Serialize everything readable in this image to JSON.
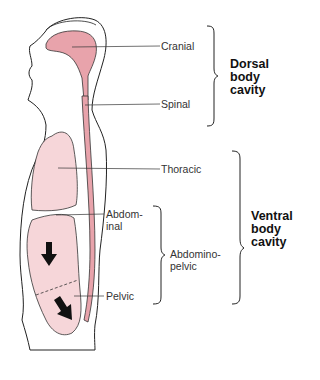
{
  "labels": {
    "cranial": "Cranial",
    "spinal": "Spinal",
    "thoracic": "Thoracic",
    "abdominal_1": "Abdom-",
    "abdominal_2": "inal",
    "abdominopelvic_1": "Abdomino-",
    "abdominopelvic_2": "pelvic",
    "pelvic": "Pelvic"
  },
  "groups": {
    "dorsal": [
      "Dorsal",
      "body",
      "cavity"
    ],
    "ventral": [
      "Ventral",
      "body",
      "cavity"
    ]
  },
  "colors": {
    "dorsal_cavity": "#e8a3ab",
    "ventral_cavity": "#f6d6d9",
    "outline": "#222222"
  }
}
